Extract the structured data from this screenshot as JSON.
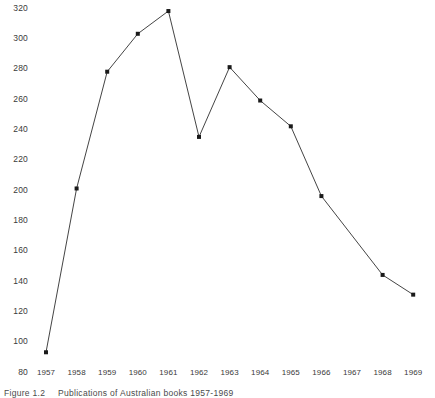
{
  "caption": {
    "label": "Figure",
    "number": "1.2",
    "text": "Publications of Australian books 1957-1969"
  },
  "axes": {
    "y_ticks": [
      320,
      300,
      280,
      260,
      240,
      220,
      200,
      180,
      160,
      140,
      120,
      100,
      80
    ],
    "x_ticks": [
      1957,
      1958,
      1959,
      1960,
      1961,
      1962,
      1963,
      1964,
      1965,
      1966,
      1967,
      1968,
      1969
    ]
  },
  "style": {
    "line_color": "#2f2f2f",
    "marker_color": "#1a1a1a",
    "background": "#ffffff",
    "tick_text_color": "#3a3a3a"
  },
  "chart_data": {
    "type": "line",
    "title": "",
    "subtitle": "",
    "xlabel": "",
    "ylabel": "",
    "xlim": [
      1956.5,
      1969.5
    ],
    "ylim": [
      80,
      320
    ],
    "grid": false,
    "legend": "none",
    "markers": "small black squares",
    "x": [
      1957,
      1958,
      1959,
      1960,
      1961,
      1962,
      1963,
      1964,
      1965,
      1966,
      1967,
      1968,
      1969
    ],
    "tick_labels": [
      "1957",
      "1958",
      "1959",
      "1960",
      "1961",
      "1962",
      "1963",
      "1964",
      "1965",
      "1966",
      "1967",
      "1968",
      "1969"
    ],
    "series": [
      {
        "name": "Publications",
        "values": [
          93,
          201,
          278,
          303,
          318,
          235,
          281,
          259,
          242,
          196,
          null,
          144,
          131
        ]
      }
    ],
    "points": [
      {
        "x": 1957,
        "y": 93
      },
      {
        "x": 1958,
        "y": 201
      },
      {
        "x": 1959,
        "y": 278
      },
      {
        "x": 1960,
        "y": 303
      },
      {
        "x": 1961,
        "y": 318
      },
      {
        "x": 1962,
        "y": 235
      },
      {
        "x": 1963,
        "y": 281
      },
      {
        "x": 1964,
        "y": 259
      },
      {
        "x": 1965,
        "y": 242
      },
      {
        "x": 1966,
        "y": 196
      },
      {
        "x": 1968,
        "y": 144
      },
      {
        "x": 1969,
        "y": 131
      }
    ],
    "annotations": []
  }
}
